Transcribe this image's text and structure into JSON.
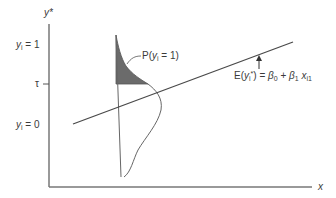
{
  "diagram": {
    "type": "latent-variable-threshold-model",
    "axes": {
      "y_label": "y*",
      "x_label": "x"
    },
    "y_ticks": [
      {
        "label_base": "y",
        "label_sub": "i",
        "label_rest": " = 1",
        "y": 45
      },
      {
        "label": "τ",
        "y": 84
      },
      {
        "label_base": "y",
        "label_sub": "i",
        "label_rest": " = 0",
        "y": 125
      }
    ],
    "regression_line": {
      "label_prefix": "E(",
      "label_var": "y",
      "label_var_sub": "i",
      "label_star": "*",
      "label_mid": ") = ",
      "beta0": "β",
      "beta0_sub": "0",
      "plus": " + ",
      "beta1": "β",
      "beta1_sub": "1",
      "x": " x",
      "x_sub": "i1",
      "from": [
        73,
        124
      ],
      "to": [
        293,
        42
      ]
    },
    "shaded_region": {
      "label_prefix": "P(",
      "label_var": "y",
      "label_var_sub": "i",
      "label_rest": " = 1)",
      "fill": "#6b6b6b"
    },
    "colors": {
      "line": "#4a4a4a",
      "axis": "#555555",
      "text": "#3a3a3a",
      "shade": "#6b6b6b"
    }
  }
}
